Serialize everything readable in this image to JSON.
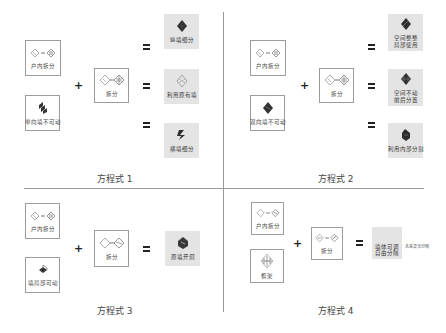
{
  "quadrants": [
    {
      "title": "方程式 1",
      "left_top": {
        "label": "户内拆分",
        "icon": "cube-split-icon"
      },
      "left_bottom": {
        "label": "单向墙不可动",
        "icon": "wall-fixed-icon"
      },
      "operator_plus": "+",
      "middle": {
        "label": "拆分",
        "icon": "cube-split-icon"
      },
      "operator_equals": "=",
      "results": [
        {
          "label": "纵墙细分",
          "icon": "longitudinal-wall-icon"
        },
        {
          "label": "利用原有墙",
          "icon": "existing-wall-icon"
        },
        {
          "label": "横墙细分",
          "icon": "transverse-wall-icon"
        }
      ]
    },
    {
      "title": "方程式 2",
      "left_top": {
        "label": "户内拆分",
        "icon": "cube-split-icon"
      },
      "left_bottom": {
        "label": "双向墙不可动",
        "icon": "wall-fixed-icon"
      },
      "operator_plus": "+",
      "middle": {
        "label": "拆分",
        "icon": "cube-split-icon"
      },
      "operator_equals": "=",
      "results": [
        {
          "label": "空间整整\n局部使用",
          "icon": "space-icon"
        },
        {
          "label": "空间不动\n前后分置",
          "icon": "space-icon"
        },
        {
          "label": "利用内部分割",
          "icon": "space-icon"
        }
      ]
    },
    {
      "title": "方程式 3",
      "left_top": {
        "label": "户内拆分",
        "icon": "cube-split-icon"
      },
      "left_bottom": {
        "label": "墙局部可动",
        "icon": "wall-partial-icon"
      },
      "operator_plus": "+",
      "middle": {
        "label": "拆分",
        "icon": "cube-split-icon"
      },
      "operator_equals": "=",
      "results": [
        {
          "label": "原墙开洞",
          "icon": "wall-opening-icon"
        }
      ]
    },
    {
      "title": "方程式 4",
      "left_top": {
        "label": "户内拆分",
        "icon": "cube-split-icon"
      },
      "left_bottom": {
        "label": "框架",
        "icon": "frame-icon"
      },
      "operator_plus": "+",
      "middle": {
        "label": "拆分",
        "icon": "cube-split-icon"
      },
      "operator_equals": "=",
      "results": [
        {
          "label": "墙体可调\n自由分隔",
          "icon": "free-partition-icon"
        }
      ],
      "side_note": "未来灵活分隔"
    }
  ],
  "colors": {
    "divider": "#9a9a9a",
    "tile_border": "#9c9c9c",
    "result_bg": "#e4e4e4",
    "icon_dark": "#2e2e2e"
  }
}
